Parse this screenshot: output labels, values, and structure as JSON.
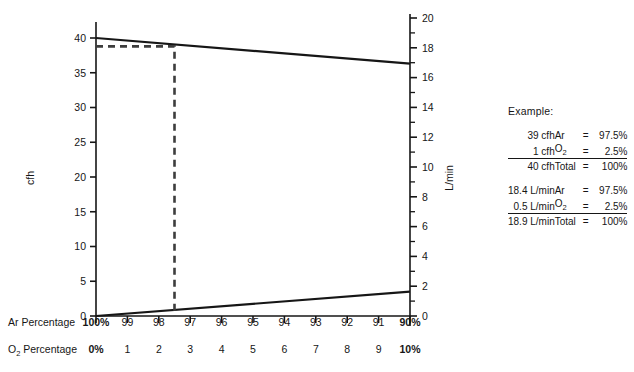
{
  "chart_data": {
    "type": "line",
    "title": "",
    "xlabel": "",
    "ylabel": "cfh",
    "y2label": "L/min",
    "grid": false,
    "legend_position": "right",
    "ylim": [
      0,
      40
    ],
    "y2lim": [
      0,
      20
    ],
    "x_axis_rows": [
      {
        "name": "Ar Percentage",
        "label": "Ar Percentage",
        "ticks": [
          "100%",
          "99",
          "98",
          "97",
          "96",
          "95",
          "94",
          "93",
          "92",
          "91",
          "90%"
        ]
      },
      {
        "name": "O2 Percentage",
        "label_prefix": "O",
        "label_sub": "2",
        "label_suffix": " Percentage",
        "ticks": [
          "0%",
          "1",
          "2",
          "3",
          "4",
          "5",
          "6",
          "7",
          "8",
          "9",
          "10%"
        ]
      }
    ],
    "y_left_ticks": [
      "0",
      "5",
      "10",
      "15",
      "20",
      "25",
      "30",
      "35",
      "40"
    ],
    "y_left_values": [
      0,
      5,
      10,
      15,
      20,
      25,
      30,
      35,
      40
    ],
    "y_right_ticks": [
      "0",
      "2",
      "4",
      "6",
      "8",
      "10",
      "12",
      "14",
      "16",
      "18",
      "20"
    ],
    "y_right_values": [
      0,
      2,
      4,
      6,
      8,
      10,
      12,
      14,
      16,
      18,
      20
    ],
    "series": [
      {
        "name": "Argon flow",
        "style": "solid",
        "x": [
          100,
          90
        ],
        "values": [
          40.0,
          36.3
        ],
        "units": "cfh"
      },
      {
        "name": "Oxygen flow",
        "style": "solid",
        "x": [
          100,
          90
        ],
        "values": [
          0.0,
          3.5
        ],
        "units": "cfh"
      }
    ],
    "annotations": [
      {
        "name": "example-guide-line",
        "style": "dashed",
        "color": "#3d3d3d",
        "x_percent": 97.5,
        "y_cfh": 38.8,
        "description": "Dashed guide from left axis at 38.8 cfh across to 97.5% Ar, then down to 0 cfh"
      }
    ]
  },
  "axes": {
    "left": {
      "title": "cfh",
      "min": 0,
      "max": 40,
      "step": 5
    },
    "right": {
      "title": "L/min",
      "min": 0,
      "max": 20,
      "step": 2,
      "minor_step": 1
    }
  },
  "example": {
    "title": "Example:",
    "columns": [
      "amount",
      "gas",
      "equals",
      "percent"
    ],
    "blocks": [
      {
        "name": "cfh-block",
        "rows": [
          {
            "amount": "39",
            "unit": "cfh",
            "gas": "Ar",
            "eq": "=",
            "value": "97.5",
            "pct": "%"
          },
          {
            "amount": "1",
            "unit": "cfh",
            "gas": "O2",
            "gas_prefix": "O",
            "gas_sub": "2",
            "eq": "=",
            "value": "2.5",
            "pct": "%"
          }
        ],
        "total": {
          "amount": "40",
          "unit": "cfh",
          "gas": "Total",
          "eq": "=",
          "value": "100",
          "pct": "%"
        }
      },
      {
        "name": "lmin-block",
        "rows": [
          {
            "amount": "18.4",
            "unit": "L/min",
            "gas": "Ar",
            "eq": "=",
            "value": "97.5",
            "pct": "%"
          },
          {
            "amount": "0.5",
            "unit": "L/min",
            "gas": "O2",
            "gas_prefix": "O",
            "gas_sub": "2",
            "eq": "=",
            "value": "2.5",
            "pct": "%"
          }
        ],
        "total": {
          "amount": "18.9",
          "unit": "L/min",
          "gas": "Total",
          "eq": "=",
          "value": "100",
          "pct": "%"
        }
      }
    ]
  },
  "colors": {
    "line": "#161616",
    "dashed": "#3d3d3d",
    "axis": "#161616",
    "background": "#ffffff"
  }
}
